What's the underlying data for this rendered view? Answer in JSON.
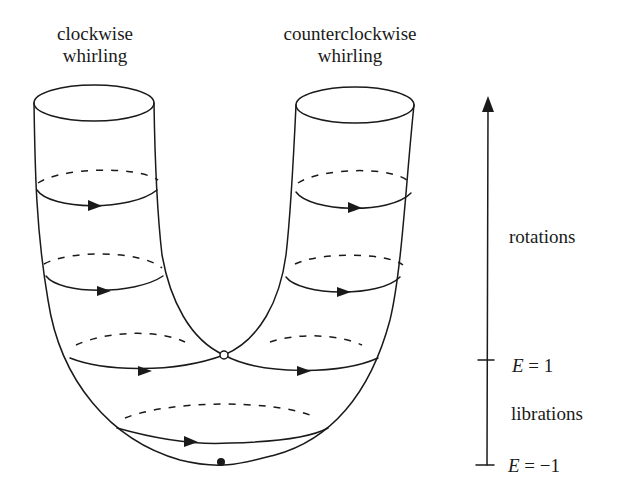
{
  "figure": {
    "left_label": {
      "line1": "clockwise",
      "line2": "whirling"
    },
    "right_label": {
      "line1": "counterclockwise",
      "line2": "whirling"
    },
    "energy_axis": {
      "region_upper": "rotations",
      "region_lower": "librations",
      "tick_upper": {
        "var": "E",
        "eq": " = 1"
      },
      "tick_lower": {
        "var": "E",
        "eq": " = −1"
      }
    },
    "points": {
      "saddle": "open-circle",
      "minimum": "filled-circle"
    },
    "colors": {
      "ink": "#1a1a1a",
      "background": "#ffffff"
    }
  }
}
